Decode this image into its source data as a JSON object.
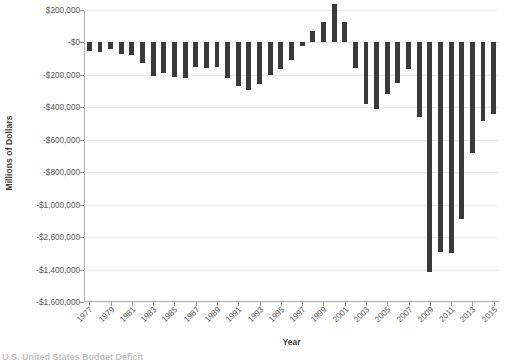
{
  "chart_data": {
    "type": "bar",
    "title": "",
    "xlabel": "Year",
    "ylabel": "Millions of Dollars",
    "grid": true,
    "legend": "none",
    "orientation": "vertical",
    "bar_color": "#3a3a3a",
    "ylim": [
      -1600000,
      200000
    ],
    "ytick_values": [
      200000,
      0,
      -200000,
      -400000,
      -600000,
      -800000,
      -1000000,
      -1200000,
      -1400000,
      -1600000
    ],
    "ytick_labels": [
      "$200,000",
      "-$0",
      "-$200,000",
      "-$400,000",
      "-$600,000",
      "-$800,000",
      "-$1,000,000",
      "-$2,600,000",
      "-$1,400,000",
      "-$1,600,000"
    ],
    "xtick_labels": [
      "1977",
      "1979",
      "1981",
      "1983",
      "1985",
      "1987",
      "1989",
      "1991",
      "1993",
      "1995",
      "1997",
      "1999",
      "2001",
      "2003",
      "2005",
      "2007",
      "2009",
      "2011",
      "2013",
      "2015"
    ],
    "xlim": [
      1977,
      2015
    ],
    "categories": [
      "1977",
      "1978",
      "1979",
      "1980",
      "1981",
      "1982",
      "1983",
      "1984",
      "1985",
      "1986",
      "1987",
      "1988",
      "1989",
      "1990",
      "1991",
      "1992",
      "1993",
      "1994",
      "1995",
      "1996",
      "1997",
      "1998",
      "1999",
      "2000",
      "2001",
      "2002",
      "2003",
      "2004",
      "2005",
      "2006",
      "2007",
      "2008",
      "2009",
      "2010",
      "2011",
      "2012",
      "2013",
      "2014",
      "2015"
    ],
    "values": [
      -53700,
      -59200,
      -40700,
      -73800,
      -79000,
      -128000,
      -207800,
      -185400,
      -212300,
      -221200,
      -149700,
      -155200,
      -152600,
      -221000,
      -269200,
      -290300,
      -255100,
      -203200,
      -164000,
      -107400,
      -21900,
      69300,
      125600,
      236200,
      128200,
      -157800,
      -377600,
      -412700,
      -318300,
      -248200,
      -160700,
      -458600,
      -1412700,
      -1294400,
      -1299600,
      -1087000,
      -679500,
      -484600,
      -438500
    ]
  },
  "axis": {
    "y_title": "Millions of Dollars",
    "x_title": "Year"
  },
  "caption": {
    "partial_text": "U.S. United States Budget Deficit"
  }
}
